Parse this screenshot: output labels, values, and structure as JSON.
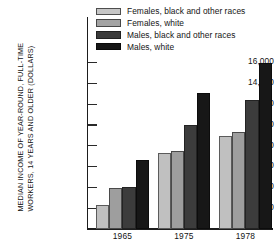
{
  "chart_data": {
    "type": "bar",
    "title": "",
    "subtitle": "",
    "xlabel": "",
    "ylabel": "MEDIAN INCOME OF YEAR-ROUND, FULL-TIME\nWORKERS, 14 YEARS AND OLDER (DOLLARS)",
    "categories": [
      "1965",
      "1975",
      "1978"
    ],
    "series": [
      {
        "name": "Females, black and other races",
        "values": [
          2300,
          7300,
          8950
        ],
        "color": "#c0c0c0"
      },
      {
        "name": "Females, white",
        "values": [
          3900,
          7500,
          9350
        ],
        "color": "#9e9e9e"
      },
      {
        "name": "Males, black and other races",
        "values": [
          4050,
          10000,
          12400
        ],
        "color": "#3c3c3c"
      },
      {
        "name": "Males, white",
        "values": [
          6600,
          13100,
          16000
        ],
        "color": "#171717"
      }
    ],
    "ylim": [
      0,
      16700
    ],
    "yticks": [
      2000,
      4000,
      6000,
      8000,
      10000,
      12000,
      14000,
      16000
    ],
    "ytick_labels": [
      "2,000",
      "4,000",
      "6,000",
      "8,000",
      "10,000",
      "12,000",
      "14,000",
      "16,000"
    ],
    "grid": false,
    "legend_position": "top-left"
  },
  "legend": {
    "items": [
      {
        "label": "Females, black and other races",
        "swatch": "swatch-light-grey"
      },
      {
        "label": "Females, white",
        "swatch": "swatch-medium-grey"
      },
      {
        "label": "Males, black and other races",
        "swatch": "swatch-dark-grey"
      },
      {
        "label": "Males, white",
        "swatch": "swatch-black"
      }
    ]
  }
}
